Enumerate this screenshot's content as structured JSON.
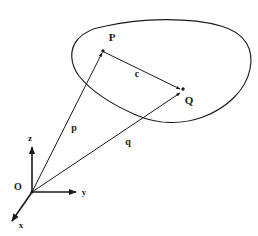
{
  "figure": {
    "stroke_color": "#1a1a1a",
    "background_color": "#ffffff"
  },
  "origin": {
    "label": "O"
  },
  "axes": [
    {
      "id": "z",
      "label": "z",
      "direction": "up"
    },
    {
      "id": "y",
      "label": "y",
      "direction": "right"
    },
    {
      "id": "x",
      "label": "x",
      "direction": "down-left"
    }
  ],
  "points": [
    {
      "id": "P",
      "label": "P"
    },
    {
      "id": "Q",
      "label": "Q"
    }
  ],
  "vectors": [
    {
      "id": "p",
      "label": "p",
      "from": "O",
      "to": "P"
    },
    {
      "id": "q",
      "label": "q",
      "from": "O",
      "to": "Q"
    },
    {
      "id": "c",
      "label": "c",
      "from": "P",
      "to": "Q"
    }
  ],
  "region": {
    "name": "body-outline"
  }
}
